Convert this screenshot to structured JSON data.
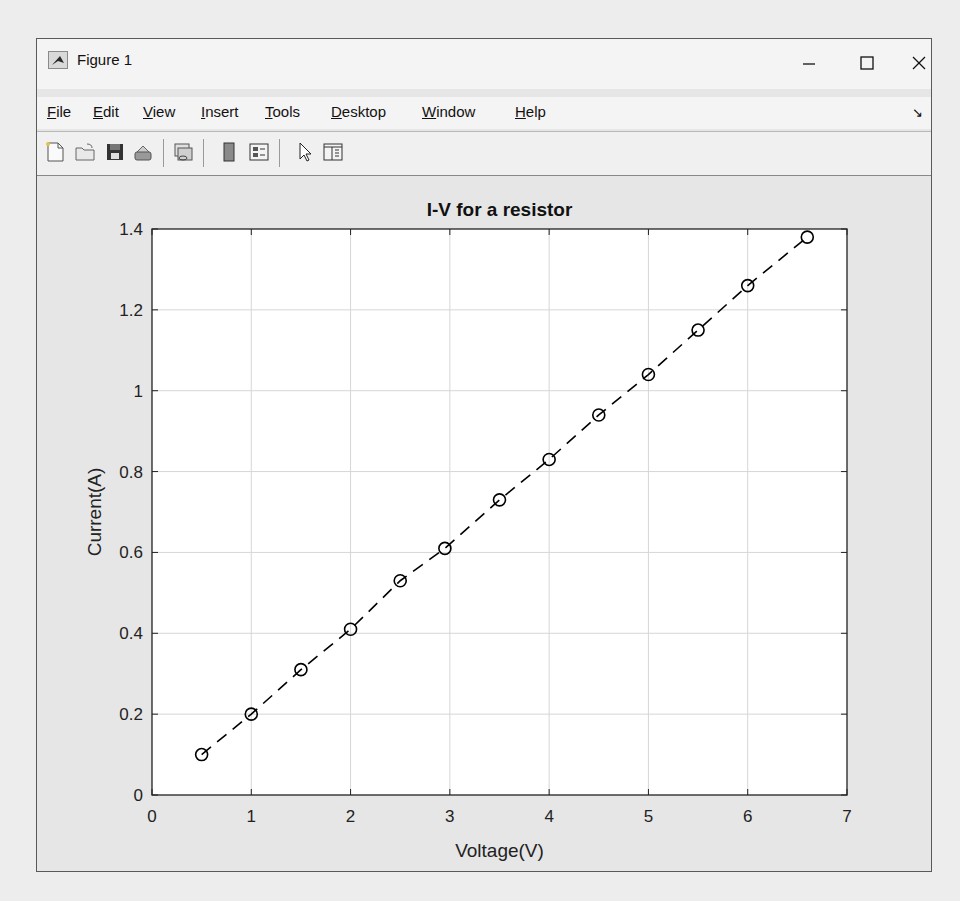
{
  "window": {
    "title": "Figure 1",
    "controls": {
      "minimize": "–",
      "maximize": "☐",
      "close": "✕"
    }
  },
  "menubar": {
    "items": [
      {
        "label": "File",
        "mnemonic": "F"
      },
      {
        "label": "Edit",
        "mnemonic": "E"
      },
      {
        "label": "View",
        "mnemonic": "V"
      },
      {
        "label": "Insert",
        "mnemonic": "I"
      },
      {
        "label": "Tools",
        "mnemonic": "T"
      },
      {
        "label": "Desktop",
        "mnemonic": "D"
      },
      {
        "label": "Window",
        "mnemonic": "W"
      },
      {
        "label": "Help",
        "mnemonic": "H"
      }
    ],
    "dock_arrow": "↘"
  },
  "toolbar": {
    "buttons": [
      {
        "name": "new-figure",
        "icon": "new-file-icon"
      },
      {
        "name": "open-file",
        "icon": "open-folder-icon"
      },
      {
        "name": "save-figure",
        "icon": "save-icon"
      },
      {
        "name": "print-figure",
        "icon": "print-icon"
      },
      {
        "name": "link-plot",
        "icon": "link-plot-icon"
      },
      {
        "name": "insert-colorbar",
        "icon": "colorbar-icon"
      },
      {
        "name": "insert-legend",
        "icon": "legend-icon"
      },
      {
        "name": "edit-plot",
        "icon": "pointer-arrow-icon"
      },
      {
        "name": "property-inspector",
        "icon": "property-panel-icon"
      }
    ]
  },
  "chart_data": {
    "type": "line",
    "title": "I-V for a resistor",
    "xlabel": "Voltage(V)",
    "ylabel": "Current(A)",
    "xlim": [
      0,
      7
    ],
    "ylim": [
      0,
      1.4
    ],
    "xticks": [
      0,
      1,
      2,
      3,
      4,
      5,
      6,
      7
    ],
    "yticks": [
      0,
      0.2,
      0.4,
      0.6,
      0.8,
      1,
      1.2,
      1.4
    ],
    "xtick_labels": [
      "0",
      "1",
      "2",
      "3",
      "4",
      "5",
      "6",
      "7"
    ],
    "ytick_labels": [
      "0",
      "0.2",
      "0.4",
      "0.6",
      "0.8",
      "1",
      "1.2",
      "1.4"
    ],
    "grid": true,
    "legend": null,
    "series": [
      {
        "name": "I-V",
        "line_style": "dashed",
        "marker": "circle-open",
        "color": "#000000",
        "x": [
          0.5,
          1.0,
          1.5,
          2.0,
          2.5,
          2.95,
          3.5,
          4.0,
          4.5,
          5.0,
          5.5,
          6.0,
          6.6
        ],
        "y": [
          0.1,
          0.2,
          0.31,
          0.41,
          0.53,
          0.61,
          0.73,
          0.83,
          0.94,
          1.04,
          1.15,
          1.26,
          1.38
        ]
      }
    ]
  }
}
